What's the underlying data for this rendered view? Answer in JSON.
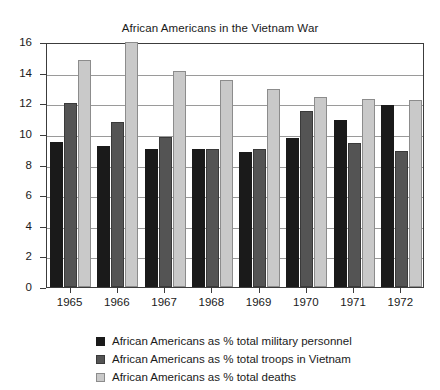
{
  "chart_data": {
    "type": "bar",
    "title": "African Americans in the Vietnam War",
    "xlabel": "",
    "ylabel": "",
    "categories": [
      "1965",
      "1966",
      "1967",
      "1968",
      "1969",
      "1970",
      "1971",
      "1972"
    ],
    "ylim": [
      0,
      16
    ],
    "yticks": [
      0,
      2,
      4,
      6,
      8,
      10,
      12,
      14,
      16
    ],
    "grid": true,
    "legend_position": "bottom",
    "series": [
      {
        "name": "African Americans as % total military personnel",
        "color": "#1a1a1a",
        "values": [
          9.5,
          9.2,
          9.0,
          9.0,
          8.8,
          9.7,
          10.9,
          11.9
        ]
      },
      {
        "name": "African Americans as % total troops in Vietnam",
        "color": "#545454",
        "values": [
          12.0,
          10.8,
          9.8,
          9.0,
          9.0,
          11.5,
          9.4,
          8.9
        ]
      },
      {
        "name": "African Americans as % total deaths",
        "color": "#c9c9c9",
        "values": [
          14.8,
          16.0,
          14.1,
          13.5,
          12.9,
          12.4,
          12.3,
          12.2
        ]
      }
    ]
  }
}
